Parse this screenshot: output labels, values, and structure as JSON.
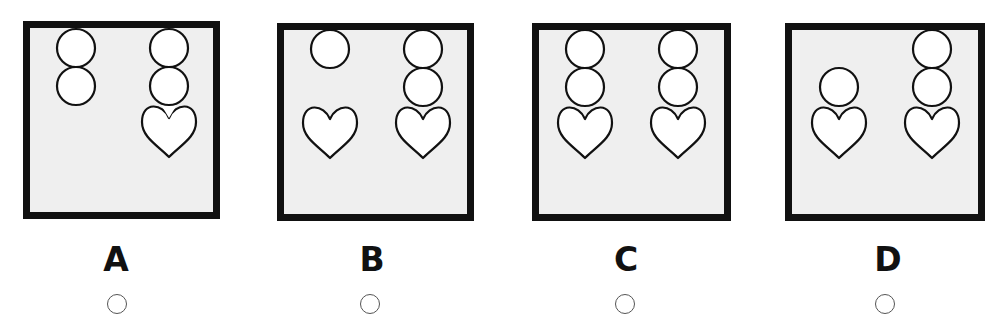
{
  "question": {
    "colors": {
      "panel_border": "#111111",
      "panel_fill": "#efefef",
      "shape_stroke": "#111111",
      "shape_fill": "#ffffff",
      "radio_stroke": "#555555"
    },
    "options": [
      {
        "label": "A",
        "panel": {
          "x": 23,
          "y": 21,
          "w": 197,
          "h": 198
        },
        "label_center_x": 116,
        "radio_center_x": 117,
        "left_column": [
          "circle",
          "circle"
        ],
        "right_column": [
          "circle",
          "circle",
          "heart"
        ]
      },
      {
        "label": "B",
        "panel": {
          "x": 277,
          "y": 23,
          "w": 197,
          "h": 198
        },
        "label_center_x": 372,
        "radio_center_x": 370,
        "left_column": [
          "circle",
          "heart"
        ],
        "right_column": [
          "circle",
          "circle",
          "heart"
        ]
      },
      {
        "label": "C",
        "panel": {
          "x": 532,
          "y": 23,
          "w": 199,
          "h": 198
        },
        "label_center_x": 626,
        "radio_center_x": 625,
        "left_column": [
          "circle",
          "circle",
          "heart"
        ],
        "right_column": [
          "circle",
          "circle",
          "heart"
        ]
      },
      {
        "label": "D",
        "panel": {
          "x": 785,
          "y": 23,
          "w": 200,
          "h": 198
        },
        "label_center_x": 888,
        "radio_center_x": 885,
        "left_column": [
          "circle",
          "heart"
        ],
        "right_column": [
          "circle",
          "circle",
          "heart"
        ]
      }
    ],
    "shape_layout": {
      "option_A": {
        "circles": [
          {
            "cx": 53,
            "cy": 27,
            "r": 19
          },
          {
            "cx": 53,
            "cy": 65,
            "r": 19
          },
          {
            "cx": 146,
            "cy": 27,
            "r": 19
          },
          {
            "cx": 146,
            "cy": 65,
            "r": 19
          }
        ],
        "hearts": [
          {
            "cx": 146,
            "top": 81
          }
        ]
      },
      "option_B": {
        "circles": [
          {
            "cx": 53,
            "cy": 26,
            "r": 19
          },
          {
            "cx": 146,
            "cy": 26,
            "r": 19
          },
          {
            "cx": 146,
            "cy": 64,
            "r": 19
          }
        ],
        "hearts": [
          {
            "cx": 53,
            "top": 80
          },
          {
            "cx": 146,
            "top": 80
          }
        ]
      },
      "option_C": {
        "circles": [
          {
            "cx": 53,
            "cy": 26,
            "r": 19
          },
          {
            "cx": 53,
            "cy": 64,
            "r": 19
          },
          {
            "cx": 146,
            "cy": 26,
            "r": 19
          },
          {
            "cx": 146,
            "cy": 64,
            "r": 19
          }
        ],
        "hearts": [
          {
            "cx": 53,
            "top": 80
          },
          {
            "cx": 146,
            "top": 80
          }
        ]
      },
      "option_D": {
        "circles": [
          {
            "cx": 54,
            "cy": 64,
            "r": 19
          },
          {
            "cx": 147,
            "cy": 26,
            "r": 19
          },
          {
            "cx": 147,
            "cy": 64,
            "r": 19
          }
        ],
        "hearts": [
          {
            "cx": 54,
            "top": 80
          },
          {
            "cx": 147,
            "top": 80
          }
        ]
      }
    }
  }
}
